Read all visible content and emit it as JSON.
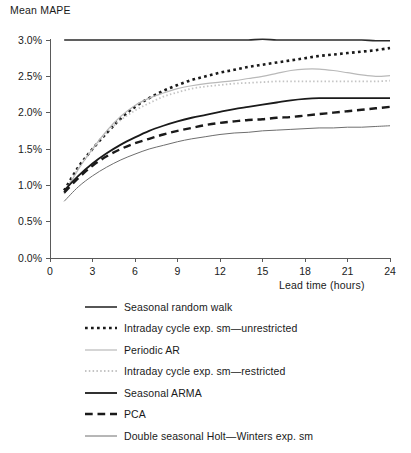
{
  "chart_data": {
    "type": "line",
    "title": "",
    "xlabel": "Lead time (hours)",
    "ylabel": "Mean MAPE",
    "xlim": [
      0,
      24
    ],
    "ylim": [
      0,
      3.0
    ],
    "grid": false,
    "legend_position": "below",
    "x_ticks": [
      "0",
      "3",
      "6",
      "9",
      "12",
      "15",
      "18",
      "21",
      "24"
    ],
    "y_ticks": [
      "0.0%",
      "0.5%",
      "1.0%",
      "1.5%",
      "2.0%",
      "2.5%",
      "3.0%"
    ],
    "x": [
      1,
      2,
      3,
      4,
      5,
      6,
      7,
      8,
      9,
      10,
      11,
      12,
      13,
      14,
      15,
      16,
      17,
      18,
      19,
      20,
      21,
      22,
      23,
      24
    ],
    "series": [
      {
        "name": "Seasonal random walk",
        "style": "solid",
        "color": "#2b2b2b",
        "width": 1.6,
        "values": [
          3.0,
          3.0,
          3.0,
          3.0,
          3.0,
          3.0,
          3.0,
          3.0,
          3.0,
          3.0,
          3.0,
          3.0,
          3.0,
          3.0,
          3.01,
          3.0,
          3.0,
          3.0,
          3.0,
          3.0,
          3.0,
          3.0,
          2.99,
          2.99
        ]
      },
      {
        "name": "Intraday cycle exp. sm—unrestricted",
        "style": "dotted-square",
        "color": "#1a1a1a",
        "width": 2.6,
        "values": [
          0.93,
          1.25,
          1.5,
          1.72,
          1.92,
          2.08,
          2.2,
          2.3,
          2.38,
          2.45,
          2.5,
          2.55,
          2.59,
          2.63,
          2.66,
          2.69,
          2.72,
          2.75,
          2.78,
          2.8,
          2.82,
          2.84,
          2.86,
          2.89
        ]
      },
      {
        "name": "Periodic AR",
        "style": "solid",
        "color": "#b9b9b9",
        "width": 1.2,
        "values": [
          0.88,
          1.22,
          1.5,
          1.75,
          1.95,
          2.1,
          2.2,
          2.27,
          2.33,
          2.37,
          2.4,
          2.42,
          2.44,
          2.47,
          2.5,
          2.54,
          2.58,
          2.6,
          2.6,
          2.58,
          2.55,
          2.52,
          2.5,
          2.51
        ]
      },
      {
        "name": "Intraday cycle exp. sm—restricted",
        "style": "dotted-fine",
        "color": "#c4c4c4",
        "width": 1.8,
        "values": [
          0.9,
          1.23,
          1.5,
          1.73,
          1.9,
          2.03,
          2.13,
          2.22,
          2.28,
          2.33,
          2.36,
          2.38,
          2.4,
          2.41,
          2.42,
          2.43,
          2.43,
          2.43,
          2.43,
          2.43,
          2.43,
          2.43,
          2.43,
          2.44
        ]
      },
      {
        "name": "Seasonal ARMA",
        "style": "solid",
        "color": "#1a1a1a",
        "width": 1.8,
        "values": [
          0.93,
          1.13,
          1.3,
          1.44,
          1.56,
          1.66,
          1.75,
          1.82,
          1.88,
          1.93,
          1.97,
          2.01,
          2.05,
          2.08,
          2.11,
          2.14,
          2.17,
          2.19,
          2.2,
          2.2,
          2.2,
          2.2,
          2.2,
          2.2
        ]
      },
      {
        "name": "PCA",
        "style": "dashed",
        "color": "#1a1a1a",
        "width": 2.4,
        "values": [
          0.9,
          1.1,
          1.27,
          1.4,
          1.5,
          1.58,
          1.64,
          1.7,
          1.75,
          1.79,
          1.83,
          1.86,
          1.88,
          1.9,
          1.91,
          1.93,
          1.94,
          1.96,
          1.98,
          2.0,
          2.02,
          2.04,
          2.06,
          2.08
        ]
      },
      {
        "name": "Double seasonal Holt—Winters exp. sm",
        "style": "solid",
        "color": "#6e6e6e",
        "width": 1.0,
        "values": [
          0.78,
          0.98,
          1.13,
          1.25,
          1.35,
          1.43,
          1.5,
          1.55,
          1.6,
          1.64,
          1.67,
          1.7,
          1.72,
          1.73,
          1.75,
          1.76,
          1.77,
          1.78,
          1.79,
          1.79,
          1.8,
          1.8,
          1.81,
          1.82
        ]
      }
    ]
  },
  "legend": {
    "items": [
      {
        "label": "Seasonal random walk"
      },
      {
        "label": "Intraday cycle exp. sm—unrestricted"
      },
      {
        "label": "Periodic AR"
      },
      {
        "label": "Intraday cycle exp. sm—restricted"
      },
      {
        "label": "Seasonal ARMA"
      },
      {
        "label": "PCA"
      },
      {
        "label": "Double seasonal Holt—Winters exp. sm"
      }
    ]
  }
}
